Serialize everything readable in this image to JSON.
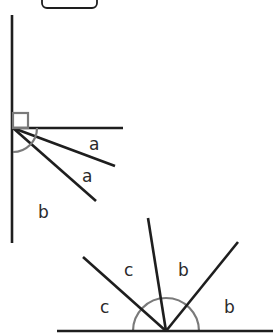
{
  "diagram": {
    "title_box": {
      "x": 42,
      "y": -10,
      "w": 55,
      "h": 18
    },
    "colors": {
      "line": "#1e1e1e",
      "marker": "#7a7a7a",
      "label": "#2a2a2a",
      "background": "#ffffff"
    },
    "figure1": {
      "vertex": [
        13,
        128
      ],
      "lines": [
        {
          "name": "vertical",
          "x1": 12,
          "y1": 15,
          "x2": 12,
          "y2": 243
        },
        {
          "name": "horizontal",
          "x1": 13,
          "y1": 128,
          "x2": 123,
          "y2": 128
        },
        {
          "name": "ray-1",
          "x1": 13,
          "y1": 128,
          "x2": 115,
          "y2": 166
        },
        {
          "name": "ray-2",
          "x1": 13,
          "y1": 128,
          "x2": 96,
          "y2": 201
        }
      ],
      "right_angle_marker": {
        "x": 13,
        "y": 113,
        "size": 15
      },
      "labels": [
        {
          "text": "a",
          "x": 89,
          "y": 150
        },
        {
          "text": "a",
          "x": 82,
          "y": 182
        },
        {
          "text": "b",
          "x": 38,
          "y": 218
        }
      ]
    },
    "figure2": {
      "vertex": [
        166,
        331
      ],
      "lines": [
        {
          "name": "base",
          "x1": 57,
          "y1": 331,
          "x2": 273,
          "y2": 331
        },
        {
          "name": "ray-left",
          "x1": 166,
          "y1": 331,
          "x2": 83,
          "y2": 257
        },
        {
          "name": "ray-middle",
          "x1": 166,
          "y1": 331,
          "x2": 148,
          "y2": 218
        },
        {
          "name": "ray-right",
          "x1": 166,
          "y1": 331,
          "x2": 238,
          "y2": 242
        }
      ],
      "arc_radius": 33,
      "labels": [
        {
          "text": "c",
          "x": 124,
          "y": 276
        },
        {
          "text": "b",
          "x": 178,
          "y": 276
        },
        {
          "text": "c",
          "x": 100,
          "y": 313
        },
        {
          "text": "b",
          "x": 224,
          "y": 313
        }
      ]
    }
  }
}
